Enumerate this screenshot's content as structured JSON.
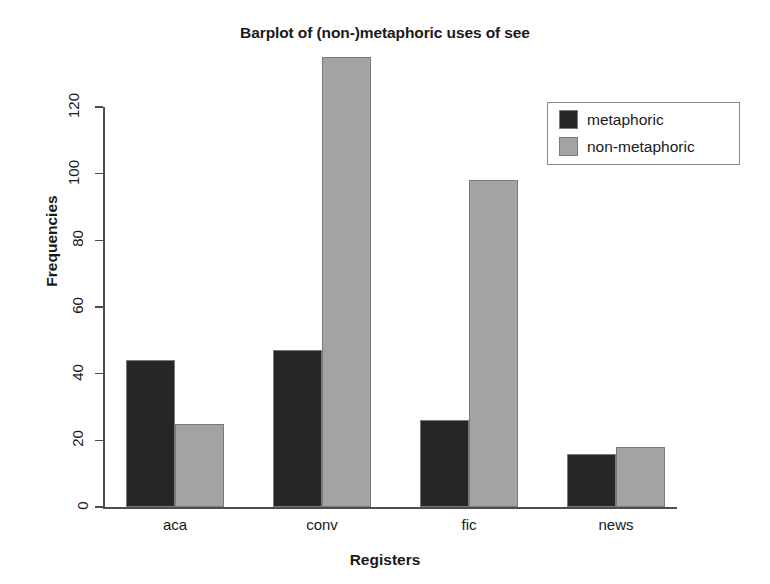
{
  "chart_data": {
    "type": "bar",
    "title": "Barplot of (non-)metaphoric uses of see",
    "xlabel": "Registers",
    "ylabel": "Frequencies",
    "categories": [
      "aca",
      "conv",
      "fic",
      "news"
    ],
    "series": [
      {
        "name": "metaphoric",
        "color": "#262626",
        "values": [
          44,
          47,
          26,
          16
        ]
      },
      {
        "name": "non-metaphoric",
        "color": "#a3a3a3",
        "values": [
          25,
          135,
          98,
          18
        ]
      }
    ],
    "ylim": [
      0,
      135
    ],
    "yticks": [
      0,
      20,
      40,
      60,
      80,
      100,
      120
    ],
    "ytick_labels": [
      "0",
      "20",
      "40",
      "60",
      "80",
      "100",
      "120"
    ],
    "grid": false,
    "legend": {
      "position": "top-right",
      "entries": [
        "metaphoric",
        "non-metaphoric"
      ]
    }
  },
  "legend": {
    "entries": [
      {
        "label": "metaphoric",
        "color": "#262626"
      },
      {
        "label": "non-metaphoric",
        "color": "#a3a3a3"
      }
    ]
  },
  "axis": {
    "y_title": "Frequencies",
    "x_title": "Registers",
    "y_ticks": [
      "0",
      "20",
      "40",
      "60",
      "80",
      "100",
      "120"
    ],
    "x_labels": [
      "aca",
      "conv",
      "fic",
      "news"
    ]
  },
  "title": "Barplot of (non-)metaphoric uses of see"
}
